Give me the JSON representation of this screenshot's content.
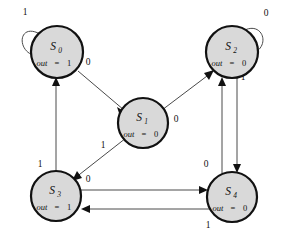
{
  "diagram": {
    "type": "finite-state-machine",
    "title": "",
    "colors": {
      "state_fill": "#d9d9d9",
      "state_stroke": "#111111",
      "edge_stroke": "#4a4a4a",
      "background": "#ffffff",
      "label_text": "#111111"
    },
    "states": [
      {
        "id": "S0",
        "name": "S",
        "subscript": "0",
        "out_label": "out",
        "out_eq": "=",
        "out_value": "1",
        "cx": 57,
        "cy": 52,
        "r": 26
      },
      {
        "id": "S1",
        "name": "S",
        "subscript": "1",
        "out_label": "out",
        "out_eq": "=",
        "out_value": "0",
        "cx": 143,
        "cy": 123,
        "r": 25
      },
      {
        "id": "S2",
        "name": "S",
        "subscript": "2",
        "out_label": "out",
        "out_eq": "=",
        "out_value": "0",
        "cx": 232,
        "cy": 52,
        "r": 26
      },
      {
        "id": "S3",
        "name": "S",
        "subscript": "3",
        "out_label": "out",
        "out_eq": "=",
        "out_value": "1",
        "cx": 56,
        "cy": 196,
        "r": 25
      },
      {
        "id": "S4",
        "name": "S",
        "subscript": "4",
        "out_label": "out",
        "out_eq": "=",
        "out_value": "0",
        "cx": 232,
        "cy": 197,
        "r": 25
      }
    ],
    "transitions": [
      {
        "id": "t-s0-s0",
        "from": "S0",
        "to": "S0",
        "input": "1",
        "kind": "self-loop",
        "label_x": 25,
        "label_y": 15
      },
      {
        "id": "t-s0-s1",
        "from": "S0",
        "to": "S1",
        "input": "0",
        "kind": "diagonal",
        "label_x": 88,
        "label_y": 65
      },
      {
        "id": "t-s1-s2",
        "from": "S1",
        "to": "S2",
        "input": "0",
        "kind": "diagonal",
        "label_x": 176,
        "label_y": 122
      },
      {
        "id": "t-s1-s3",
        "from": "S1",
        "to": "S3",
        "input": "1",
        "kind": "diagonal",
        "label_x": 103,
        "label_y": 148
      },
      {
        "id": "t-s2-s2",
        "from": "S2",
        "to": "S2",
        "input": "0",
        "kind": "self-loop",
        "label_x": 266,
        "label_y": 16
      },
      {
        "id": "t-s2-s4",
        "from": "S2",
        "to": "S4",
        "input": "1",
        "kind": "vertical",
        "label_x": 243,
        "label_y": 80
      },
      {
        "id": "t-s3-s0",
        "from": "S3",
        "to": "S0",
        "input": "1",
        "kind": "vertical",
        "label_x": 40,
        "label_y": 167
      },
      {
        "id": "t-s3-s4",
        "from": "S3",
        "to": "S4",
        "input": "0",
        "kind": "horizontal",
        "label_x": 88,
        "label_y": 182
      },
      {
        "id": "t-s4-s2",
        "from": "S4",
        "to": "S2",
        "input": "0",
        "kind": "vertical",
        "label_x": 206,
        "label_y": 167
      },
      {
        "id": "t-s4-s3",
        "from": "S4",
        "to": "S3",
        "input": "1",
        "kind": "horizontal",
        "label_x": 208,
        "label_y": 228
      }
    ]
  }
}
